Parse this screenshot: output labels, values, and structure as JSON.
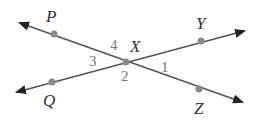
{
  "diagram": {
    "type": "intersecting-lines",
    "colors": {
      "line": "#555555",
      "point": "#8a8a8a",
      "angle_label": "#777777",
      "point_label": "#333333"
    },
    "points": {
      "P": {
        "label": "P",
        "x": 54,
        "y": 34,
        "lx": 46,
        "ly": 22
      },
      "Q": {
        "label": "Q",
        "x": 52,
        "y": 82,
        "lx": 43,
        "ly": 106
      },
      "X": {
        "label": "X",
        "x": 126,
        "y": 62,
        "lx": 130,
        "ly": 52
      },
      "Y": {
        "label": "Y",
        "x": 201,
        "y": 41,
        "lx": 196,
        "ly": 29
      },
      "Z": {
        "label": "Z",
        "x": 199,
        "y": 89,
        "lx": 194,
        "ly": 114
      }
    },
    "lines": [
      {
        "name": "line-PZ",
        "from": [
          20,
          23
        ],
        "to": [
          242,
          102
        ]
      },
      {
        "name": "line-QY",
        "from": [
          17,
          92
        ],
        "to": [
          244,
          31
        ]
      }
    ],
    "angles": [
      {
        "label": "1",
        "x": 161,
        "y": 72
      },
      {
        "label": "2",
        "x": 121,
        "y": 81
      },
      {
        "label": "3",
        "x": 89,
        "y": 66
      },
      {
        "label": "4",
        "x": 110,
        "y": 50
      }
    ]
  }
}
